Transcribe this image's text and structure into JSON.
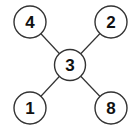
{
  "diagram": {
    "type": "star-graph",
    "nodes": [
      {
        "id": "center",
        "label": "3",
        "x": 70,
        "y": 65
      },
      {
        "id": "top-left",
        "label": "4",
        "x": 30,
        "y": 22
      },
      {
        "id": "top-right",
        "label": "2",
        "x": 111,
        "y": 22
      },
      {
        "id": "bottom-left",
        "label": "1",
        "x": 30,
        "y": 108
      },
      {
        "id": "bottom-right",
        "label": "8",
        "x": 111,
        "y": 108
      }
    ],
    "edges": [
      {
        "from": "center",
        "to": "top-left"
      },
      {
        "from": "center",
        "to": "top-right"
      },
      {
        "from": "center",
        "to": "bottom-left"
      },
      {
        "from": "center",
        "to": "bottom-right"
      }
    ]
  }
}
